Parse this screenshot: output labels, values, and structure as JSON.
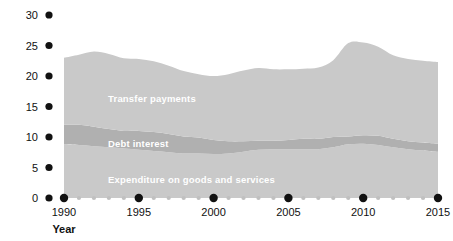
{
  "chart_data": {
    "type": "area",
    "stacked": true,
    "title": "",
    "xlabel": "Year",
    "ylabel": "Outlays (percentage of GDP)",
    "xlim": [
      1990,
      2015
    ],
    "ylim": [
      0,
      30
    ],
    "xticks": [
      1990,
      1995,
      2000,
      2005,
      2010,
      2015
    ],
    "xtick_labels": [
      "1990",
      "1995",
      "2000",
      "2005",
      "2010",
      "2015"
    ],
    "yticks": [
      0,
      5,
      10,
      15,
      20,
      25,
      30
    ],
    "ytick_labels": [
      "0",
      "5",
      "10",
      "15",
      "20",
      "25",
      "30"
    ],
    "grid": false,
    "legend": "inline-labels",
    "x": [
      1990,
      1991,
      1992,
      1993,
      1994,
      1995,
      1996,
      1997,
      1998,
      1999,
      2000,
      2001,
      2002,
      2003,
      2004,
      2005,
      2006,
      2007,
      2008,
      2009,
      2010,
      2011,
      2012,
      2013,
      2014,
      2015
    ],
    "series": [
      {
        "name": "Expenditure on goods and services",
        "color": "#c9c9c9",
        "values": [
          8.8,
          8.7,
          8.5,
          8.3,
          8.1,
          7.9,
          7.7,
          7.5,
          7.3,
          7.3,
          7.2,
          7.3,
          7.6,
          7.9,
          8.0,
          8.0,
          8.0,
          8.0,
          8.3,
          8.8,
          8.9,
          8.7,
          8.3,
          8.0,
          7.8,
          7.6
        ]
      },
      {
        "name": "Debt interest",
        "color": "#b0b0b0",
        "values": [
          3.2,
          3.3,
          3.2,
          3.0,
          2.9,
          3.1,
          3.1,
          3.0,
          2.8,
          2.6,
          2.3,
          2.0,
          1.7,
          1.5,
          1.4,
          1.5,
          1.7,
          1.7,
          1.7,
          1.3,
          1.4,
          1.5,
          1.4,
          1.3,
          1.3,
          1.3
        ]
      },
      {
        "name": "Transfer payments",
        "color": "#c9c9c9",
        "values": [
          11.0,
          11.5,
          12.3,
          12.3,
          11.9,
          11.8,
          11.6,
          11.2,
          10.7,
          10.4,
          10.5,
          11.0,
          11.6,
          11.9,
          11.7,
          11.6,
          11.5,
          11.7,
          12.6,
          15.3,
          15.2,
          14.6,
          13.7,
          13.5,
          13.4,
          13.4
        ]
      }
    ],
    "band_labels": [
      {
        "name": "Transfer payments",
        "text": "Transfer payments"
      },
      {
        "name": "Debt interest",
        "text": "Debt interest"
      },
      {
        "name": "Expenditure on goods and services",
        "text": "Expenditure on goods and services"
      }
    ],
    "colors": {
      "band_light": "#c9c9c9",
      "band_dark": "#b0b0b0",
      "tick_major": "#111111",
      "tick_minor": "#c0c0c0",
      "text": "#111111",
      "band_label_text": "#ffffff",
      "background": "#ffffff"
    }
  }
}
